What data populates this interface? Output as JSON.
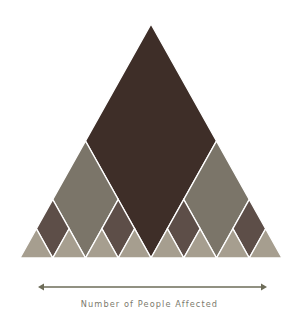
{
  "diagram": {
    "type": "sierpinski-style triangle (diamond subdivision)",
    "triangle": {
      "apex": [
        151,
        24
      ],
      "base_left": [
        20,
        258
      ],
      "base_right": [
        282,
        258
      ]
    },
    "levels": 3,
    "colors": {
      "level1_diamond": "#3e2e28",
      "level2_diamond": "#7b7569",
      "level3_diamond": "#5d4e48",
      "corner_triangle": "#a69e8f",
      "gap": "#ffffff",
      "axis": "#6d6c58"
    },
    "counts": {
      "level1_diamonds": 1,
      "level2_diamonds": 2,
      "level3_diamonds": 4,
      "corner_triangles": 8
    }
  },
  "axis": {
    "label": "Number of People Affected",
    "arrow": "double-headed",
    "x_start": 38,
    "x_end": 267,
    "y": 287
  }
}
